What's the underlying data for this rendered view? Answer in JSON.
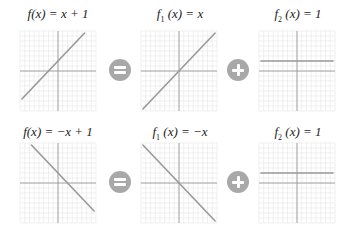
{
  "rows": [
    {
      "equation": {
        "name": "f",
        "sub": "",
        "rhs": "x + 1",
        "slope": 1,
        "intercept": 1
      },
      "operator1": "equals",
      "term1": {
        "name": "f",
        "sub": "1",
        "rhs": "x",
        "slope": 1,
        "intercept": 0
      },
      "operator2": "plus",
      "term2": {
        "name": "f",
        "sub": "2",
        "rhs": "1",
        "slope": 0,
        "intercept": 1
      }
    },
    {
      "equation": {
        "name": "f",
        "sub": "",
        "rhs": "−x + 1",
        "slope": -1,
        "intercept": 1
      },
      "operator1": "equals",
      "term1": {
        "name": "f",
        "sub": "1",
        "rhs": "−x",
        "slope": -1,
        "intercept": 0
      },
      "operator2": "plus",
      "term2": {
        "name": "f",
        "sub": "2",
        "rhs": "1",
        "slope": 0,
        "intercept": 1
      }
    }
  ],
  "labels": {
    "r0c0": "f(x) = x + 1",
    "r0c1_name": "f",
    "r0c1_sub": "1",
    "r0c1_rest": "(x) = x",
    "r0c2_name": "f",
    "r0c2_sub": "2",
    "r0c2_rest": "(x) = 1",
    "r1c0": "f(x) = −x + 1",
    "r1c1_name": "f",
    "r1c1_sub": "1",
    "r1c1_rest": "(x) = −x",
    "r1c2_name": "f",
    "r1c2_sub": "2",
    "r1c2_rest": "(x) = 1"
  },
  "grid": {
    "x_range": [
      -4,
      4
    ],
    "y_range": [
      -4,
      4
    ]
  },
  "colors": {
    "line": "#999999",
    "axis": "#9a9a9a",
    "grid": "#e6e6e6",
    "operator": "#a8a8a8"
  }
}
